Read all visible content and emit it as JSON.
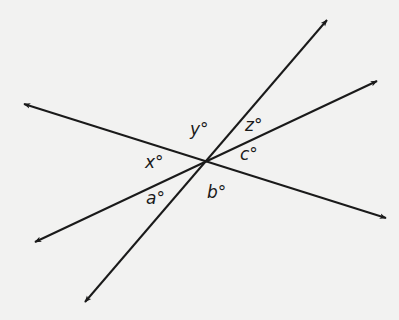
{
  "diagram": {
    "type": "intersecting-lines",
    "intersection": [
      206,
      162
    ],
    "lines": [
      {
        "id": "line-1",
        "from": [
          24,
          104
        ],
        "to": [
          386,
          218
        ],
        "arrows": "both"
      },
      {
        "id": "line-2",
        "from": [
          35,
          242
        ],
        "to": [
          377,
          81
        ],
        "arrows": "both"
      },
      {
        "id": "line-3",
        "from": [
          85,
          302
        ],
        "to": [
          327,
          20
        ],
        "arrows": "both"
      }
    ],
    "angle_labels": {
      "y": {
        "text": "y°",
        "pos": [
          190,
          135
        ]
      },
      "z": {
        "text": "z°",
        "pos": [
          245,
          131
        ]
      },
      "x": {
        "text": "x°",
        "pos": [
          145,
          168
        ]
      },
      "c": {
        "text": "c°",
        "pos": [
          240,
          160
        ]
      },
      "a": {
        "text": "a°",
        "pos": [
          146,
          204
        ]
      },
      "b": {
        "text": "b°",
        "pos": [
          207,
          198
        ]
      }
    },
    "colors": {
      "background": "#f2f2f1",
      "stroke": "#1a1a1a"
    }
  }
}
